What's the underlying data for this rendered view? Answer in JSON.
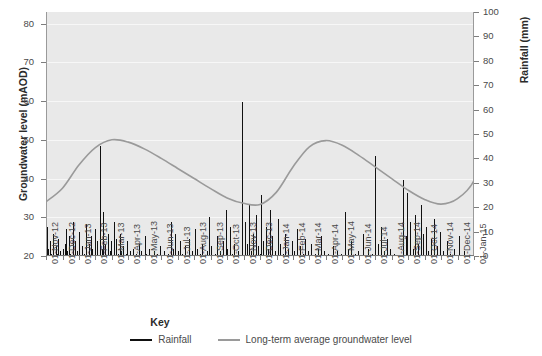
{
  "chart_data": {
    "type": "bar",
    "title": "",
    "xlabel": "",
    "ylabel": "Groundwater level (mAOD)",
    "y2label": "Rainfall (mm)",
    "ylim": [
      20,
      83
    ],
    "y2lim": [
      0,
      100
    ],
    "grid": true,
    "legend_position": "bottom-center",
    "y_ticks": [
      20,
      30,
      40,
      50,
      60,
      70,
      80
    ],
    "y2_ticks": [
      0,
      10,
      20,
      30,
      40,
      50,
      60,
      70,
      80,
      90,
      100
    ],
    "x_ticks": [
      "01-Nov-12",
      "01-Dec-12",
      "01-Jan-13",
      "01-Feb-13",
      "01-Mar-13",
      "01-Apr-13",
      "01-May-13",
      "01-Jun-13",
      "01-Jul-13",
      "01-Aug-13",
      "01-Sep-13",
      "01-Oct-13",
      "01-Nov-13",
      "01-Dec-13",
      "01-Jan-14",
      "01-Feb-14",
      "01-Mar-14",
      "01-Apr-14",
      "01-May-14",
      "01-Jun-14",
      "01-Jul-14",
      "01-Aug-14",
      "01-Sep-14",
      "01-Oct-14",
      "01-Nov-14",
      "01-Dec-14",
      "01-Jan-15"
    ],
    "series": [
      {
        "name": "Rainfall",
        "axis": "right",
        "units": "mm",
        "color": "#111111",
        "type": "bar",
        "values": [
          0,
          0,
          12,
          0,
          3,
          0,
          0,
          6,
          1,
          0,
          0,
          9,
          2,
          0,
          0,
          0,
          4,
          0,
          1,
          0,
          0,
          7,
          0,
          0,
          2,
          0,
          0,
          0,
          3,
          0,
          0,
          0,
          5,
          11,
          0,
          0,
          2,
          0,
          0,
          8,
          0,
          1,
          0,
          0,
          0,
          14,
          3,
          0,
          0,
          6,
          0,
          0,
          2,
          0,
          0,
          10,
          1,
          0,
          0,
          0,
          0,
          4,
          0,
          0,
          1,
          0,
          0,
          13,
          2,
          0,
          0,
          0,
          5,
          0,
          0,
          8,
          0,
          0,
          3,
          0,
          0,
          0,
          11,
          2,
          0,
          0,
          6,
          0,
          0,
          0,
          45,
          9,
          0,
          0,
          3,
          0,
          18,
          0,
          0,
          5,
          1,
          0,
          0,
          0,
          9,
          0,
          0,
          2,
          0,
          0,
          6,
          0,
          0,
          0,
          14,
          3,
          0,
          0,
          7,
          0,
          0,
          1,
          0,
          0,
          0,
          9,
          2,
          0,
          0,
          4,
          0,
          0,
          0,
          0,
          1,
          0,
          0,
          6,
          0,
          0,
          0,
          2,
          0,
          0,
          0,
          0,
          3,
          0,
          0,
          0,
          0,
          1,
          0,
          0,
          0,
          0,
          5,
          0,
          0,
          0,
          2,
          0,
          0,
          0,
          0,
          0,
          8,
          0,
          0,
          1,
          0,
          0,
          0,
          0,
          3,
          0,
          0,
          0,
          0,
          0,
          0,
          2,
          0,
          0,
          0,
          0,
          0,
          1,
          0,
          0,
          0,
          0,
          4,
          0,
          0,
          0,
          0,
          0,
          0,
          2,
          0,
          0,
          0,
          0,
          0,
          0,
          1,
          0,
          0,
          0,
          14,
          0,
          0,
          3,
          0,
          0,
          0,
          9,
          0,
          0,
          0,
          0,
          2,
          0,
          0,
          6,
          0,
          0,
          0,
          1,
          0,
          0,
          0,
          0,
          4,
          0,
          0,
          0,
          0,
          0,
          0,
          7,
          0,
          0,
          0,
          2,
          0,
          0,
          0,
          0,
          11,
          0,
          0,
          0,
          3,
          0,
          0,
          0,
          0,
          1,
          0,
          0,
          0,
          5,
          0,
          0,
          0,
          0,
          0,
          0,
          2,
          0,
          0,
          0,
          0,
          16,
          0,
          0,
          4,
          0,
          0,
          0,
          0,
          0,
          1,
          0,
          0,
          0,
          8,
          0,
          0,
          0,
          2,
          0,
          0,
          0,
          0,
          0,
          6,
          0,
          0,
          0,
          19,
          0,
          0,
          3,
          0,
          0,
          0,
          0,
          12,
          0,
          0,
          1,
          0,
          0,
          0,
          5,
          0,
          0,
          0,
          0,
          0,
          2,
          0,
          0,
          0,
          0,
          0,
          0,
          63,
          0,
          0,
          0,
          14,
          0,
          0,
          0,
          5,
          0,
          0,
          21,
          0,
          0,
          0,
          2,
          0,
          0,
          9,
          0,
          0,
          0,
          0,
          17,
          0,
          0,
          4,
          0,
          0,
          0,
          1,
          0,
          25,
          0,
          0,
          6,
          0,
          0,
          0,
          0,
          12,
          0,
          0,
          0,
          3,
          0,
          0,
          19,
          0,
          0,
          0,
          8,
          0,
          0,
          0,
          0,
          2,
          0,
          0,
          0,
          0,
          15,
          0,
          0,
          5,
          0,
          0,
          0,
          0,
          1,
          0,
          0,
          9,
          0,
          0,
          0,
          0,
          3,
          0,
          0,
          0,
          0,
          0,
          6,
          0,
          0,
          0,
          2,
          0,
          0,
          0,
          0,
          0,
          11,
          0,
          0,
          0,
          4,
          0,
          0,
          0,
          0,
          1,
          0,
          0,
          0,
          7,
          0,
          0,
          0,
          0,
          2,
          0,
          0,
          0,
          0,
          5,
          0,
          0,
          0,
          0,
          0,
          1,
          0,
          0,
          0,
          0,
          0,
          3,
          0,
          0,
          0,
          0,
          8,
          0,
          0,
          0,
          0,
          2,
          0,
          0,
          0,
          0,
          0,
          0,
          1,
          0,
          0,
          0,
          0,
          0,
          0,
          0,
          4,
          0,
          0,
          0,
          0,
          0,
          0,
          2,
          0,
          0,
          0,
          0,
          0,
          0,
          1,
          0,
          0,
          0,
          0,
          0,
          18,
          0,
          0,
          0,
          0,
          3,
          0,
          0,
          0,
          0,
          6,
          0,
          0,
          0,
          0,
          0,
          1,
          0,
          0,
          0,
          0,
          0,
          2,
          0,
          0,
          0,
          0,
          0,
          0,
          0,
          0,
          9,
          0,
          0,
          0,
          0,
          0,
          0,
          3,
          0,
          0,
          0,
          0,
          0,
          0,
          1,
          0,
          0,
          0,
          0,
          41,
          0,
          0,
          0,
          0,
          5,
          0,
          0,
          0,
          0,
          12,
          0,
          0,
          0,
          0,
          2,
          0,
          0,
          0,
          0,
          7,
          0,
          0,
          0,
          0,
          0,
          3,
          0,
          0,
          0,
          0,
          0,
          1,
          0,
          0,
          0,
          0,
          0,
          0,
          0,
          0,
          0,
          0,
          0,
          0,
          0,
          0,
          31,
          0,
          0,
          0,
          0,
          8,
          0,
          0,
          26,
          0,
          0,
          0,
          0,
          14,
          0,
          0,
          0,
          3,
          0,
          0,
          0,
          17,
          0,
          0,
          0,
          5,
          0,
          0,
          0,
          0,
          21,
          0,
          0,
          0,
          9,
          0,
          0,
          0,
          0,
          12,
          0,
          0,
          0,
          2,
          0,
          0,
          0,
          0,
          7,
          0,
          0,
          0,
          0,
          15,
          0,
          0,
          0,
          4,
          0,
          0,
          0,
          0,
          0,
          10,
          0,
          0,
          0,
          0,
          2,
          0,
          0,
          0,
          0,
          0,
          6,
          0,
          0,
          0,
          0,
          0,
          1,
          0,
          0,
          0,
          0,
          0,
          3,
          0,
          0,
          0,
          0,
          0,
          0,
          0,
          0,
          8,
          0,
          0,
          0,
          0,
          0,
          0,
          0,
          2,
          0,
          0,
          0,
          0,
          0,
          0,
          0,
          0,
          0,
          0,
          0,
          0,
          0,
          0,
          0,
          0
        ]
      },
      {
        "name": "Long-term average groundwater level",
        "axis": "left",
        "units": "mAOD",
        "color": "#9a9a9a",
        "type": "line",
        "points": [
          {
            "x": "01-Nov-12",
            "y": 34.0
          },
          {
            "x": "01-Dec-12",
            "y": 37.5
          },
          {
            "x": "01-Jan-13",
            "y": 43.5
          },
          {
            "x": "01-Feb-13",
            "y": 48.0
          },
          {
            "x": "01-Mar-13",
            "y": 50.0
          },
          {
            "x": "01-Apr-13",
            "y": 49.4
          },
          {
            "x": "01-May-13",
            "y": 47.6
          },
          {
            "x": "01-Jun-13",
            "y": 45.2
          },
          {
            "x": "01-Jul-13",
            "y": 42.6
          },
          {
            "x": "01-Aug-13",
            "y": 40.0
          },
          {
            "x": "01-Sep-13",
            "y": 37.4
          },
          {
            "x": "01-Oct-13",
            "y": 35.0
          },
          {
            "x": "01-Nov-13",
            "y": 33.6
          },
          {
            "x": "01-Dec-13",
            "y": 33.3
          },
          {
            "x": "01-Jan-14",
            "y": 36.5
          },
          {
            "x": "01-Feb-14",
            "y": 43.0
          },
          {
            "x": "01-Mar-14",
            "y": 48.2
          },
          {
            "x": "01-Apr-14",
            "y": 49.8
          },
          {
            "x": "01-May-14",
            "y": 48.6
          },
          {
            "x": "01-Jun-14",
            "y": 46.0
          },
          {
            "x": "01-Jul-14",
            "y": 43.0
          },
          {
            "x": "01-Aug-14",
            "y": 40.0
          },
          {
            "x": "01-Sep-14",
            "y": 37.0
          },
          {
            "x": "01-Oct-14",
            "y": 34.6
          },
          {
            "x": "01-Nov-14",
            "y": 33.4
          },
          {
            "x": "01-Dec-14",
            "y": 34.8
          },
          {
            "x": "01-Jan-15",
            "y": 39.5
          },
          {
            "x": "end",
            "y": 47.5
          }
        ]
      }
    ]
  },
  "key": {
    "title": "Key",
    "items": [
      {
        "label": "Rainfall",
        "color": "#111111"
      },
      {
        "label": "Long-term average groundwater level",
        "color": "#9a9a9a"
      }
    ]
  }
}
